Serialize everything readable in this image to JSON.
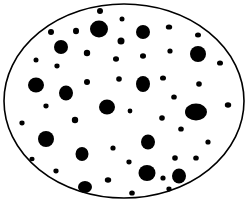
{
  "colors": {
    "background": "#ffffff",
    "ink": "#000000"
  },
  "outline": {
    "cx": 124,
    "cy": 101,
    "rx": 120,
    "ry": 97,
    "stroke_width": 1.6
  },
  "dots": [
    {
      "x": 99,
      "y": 29,
      "rx": 9,
      "ry": 8.5
    },
    {
      "x": 61,
      "y": 47,
      "rx": 7,
      "ry": 7
    },
    {
      "x": 36,
      "y": 85,
      "rx": 8,
      "ry": 7.5
    },
    {
      "x": 66,
      "y": 93,
      "rx": 7,
      "ry": 7.5
    },
    {
      "x": 143,
      "y": 32,
      "rx": 7,
      "ry": 7
    },
    {
      "x": 198,
      "y": 54,
      "rx": 8,
      "ry": 8
    },
    {
      "x": 143,
      "y": 84,
      "rx": 7,
      "ry": 8
    },
    {
      "x": 107,
      "y": 107,
      "rx": 8,
      "ry": 7.5
    },
    {
      "x": 46,
      "y": 139,
      "rx": 8,
      "ry": 8
    },
    {
      "x": 82,
      "y": 154,
      "rx": 6.5,
      "ry": 7
    },
    {
      "x": 85,
      "y": 187,
      "rx": 7,
      "ry": 6
    },
    {
      "x": 196,
      "y": 112,
      "rx": 11,
      "ry": 8.5
    },
    {
      "x": 148,
      "y": 142,
      "rx": 7,
      "ry": 7.5
    },
    {
      "x": 147,
      "y": 173,
      "rx": 8.5,
      "ry": 8
    },
    {
      "x": 179,
      "y": 176,
      "rx": 7,
      "ry": 7.5
    },
    {
      "x": 100,
      "y": 11,
      "rx": 3,
      "ry": 3
    },
    {
      "x": 51,
      "y": 32,
      "rx": 3,
      "ry": 3
    },
    {
      "x": 76,
      "y": 31,
      "rx": 3,
      "ry": 3.2
    },
    {
      "x": 87,
      "y": 53,
      "rx": 3.2,
      "ry": 3.2
    },
    {
      "x": 36,
      "y": 60,
      "rx": 2.5,
      "ry": 2.5
    },
    {
      "x": 57,
      "y": 66,
      "rx": 2.6,
      "ry": 2.4
    },
    {
      "x": 87,
      "y": 82,
      "rx": 3,
      "ry": 3
    },
    {
      "x": 116,
      "y": 59,
      "rx": 3,
      "ry": 2.8
    },
    {
      "x": 119,
      "y": 79,
      "rx": 2.8,
      "ry": 2.8
    },
    {
      "x": 121,
      "y": 41,
      "rx": 3.5,
      "ry": 3.5
    },
    {
      "x": 122,
      "y": 19,
      "rx": 2.5,
      "ry": 2.5
    },
    {
      "x": 169,
      "y": 27,
      "rx": 3.2,
      "ry": 2.6
    },
    {
      "x": 198,
      "y": 35,
      "rx": 3,
      "ry": 2.5
    },
    {
      "x": 143,
      "y": 56,
      "rx": 3,
      "ry": 2.8
    },
    {
      "x": 170,
      "y": 51,
      "rx": 2.6,
      "ry": 2.6
    },
    {
      "x": 220,
      "y": 63,
      "rx": 3,
      "ry": 2.6
    },
    {
      "x": 163,
      "y": 78,
      "rx": 3,
      "ry": 2.6
    },
    {
      "x": 199,
      "y": 84,
      "rx": 2.8,
      "ry": 2.8
    },
    {
      "x": 174,
      "y": 97,
      "rx": 2.8,
      "ry": 2.6
    },
    {
      "x": 46,
      "y": 106,
      "rx": 2.6,
      "ry": 2.4
    },
    {
      "x": 22,
      "y": 123,
      "rx": 2.6,
      "ry": 2.4
    },
    {
      "x": 75,
      "y": 120,
      "rx": 3.2,
      "ry": 3.2
    },
    {
      "x": 113,
      "y": 148,
      "rx": 2.6,
      "ry": 2.6
    },
    {
      "x": 32,
      "y": 159,
      "rx": 2.6,
      "ry": 2.2
    },
    {
      "x": 56,
      "y": 171,
      "rx": 2.6,
      "ry": 2.4
    },
    {
      "x": 108,
      "y": 180,
      "rx": 3.2,
      "ry": 2.8
    },
    {
      "x": 228,
      "y": 105,
      "rx": 3.2,
      "ry": 2.8
    },
    {
      "x": 130,
      "y": 111,
      "rx": 2.4,
      "ry": 2.4
    },
    {
      "x": 162,
      "y": 118,
      "rx": 2.8,
      "ry": 2.8
    },
    {
      "x": 181,
      "y": 129,
      "rx": 2.8,
      "ry": 2.6
    },
    {
      "x": 208,
      "y": 142,
      "rx": 2.6,
      "ry": 2.6
    },
    {
      "x": 129,
      "y": 162,
      "rx": 2.6,
      "ry": 2.4
    },
    {
      "x": 175,
      "y": 158,
      "rx": 2.8,
      "ry": 2.8
    },
    {
      "x": 196,
      "y": 158,
      "rx": 2.8,
      "ry": 2.6
    },
    {
      "x": 163,
      "y": 178,
      "rx": 2.6,
      "ry": 2.6
    },
    {
      "x": 132,
      "y": 193,
      "rx": 2.8,
      "ry": 2.6
    },
    {
      "x": 169,
      "y": 189,
      "rx": 2.6,
      "ry": 2.4
    }
  ]
}
